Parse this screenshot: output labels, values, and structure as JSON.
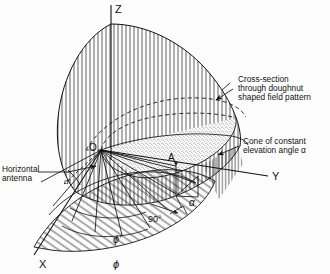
{
  "figure": {
    "background_color": "#fdfdfd",
    "ink_color": "#111111"
  },
  "axes": [
    {
      "name": "z-axis",
      "label": "Z"
    },
    {
      "name": "y-axis",
      "label": "Y"
    },
    {
      "name": "x-axis",
      "label": "X"
    }
  ],
  "points": [
    {
      "name": "origin",
      "label": "O"
    },
    {
      "name": "point-a",
      "label": "A"
    }
  ],
  "angles": [
    {
      "name": "azimuth-phi",
      "label": "ϕ"
    },
    {
      "name": "azimuth-phi-prime",
      "label": "ϕ'"
    },
    {
      "name": "elevation-alpha",
      "label": "α"
    },
    {
      "name": "elevation-alpha-prime",
      "label": "α'"
    },
    {
      "name": "right-angle",
      "label": "90°"
    }
  ],
  "callouts": [
    {
      "name": "cross-section-callout",
      "lines": [
        "Cross-section",
        "through  doughnut",
        "shaped field pattern"
      ]
    },
    {
      "name": "cone-callout",
      "lines": [
        "Cone of constant",
        "elevation angle α"
      ]
    },
    {
      "name": "horizontal-antenna-callout",
      "lines": [
        "Horizontal",
        "antenna"
      ]
    }
  ],
  "regions": [
    {
      "name": "doughnut-cross-section",
      "fill": "vertical-hatch"
    },
    {
      "name": "cone-surface",
      "fill": "stipple"
    },
    {
      "name": "ground-annulus",
      "fill": "diagonal-hatch"
    },
    {
      "name": "y-side-panel",
      "fill": "vertical-hatch"
    }
  ]
}
